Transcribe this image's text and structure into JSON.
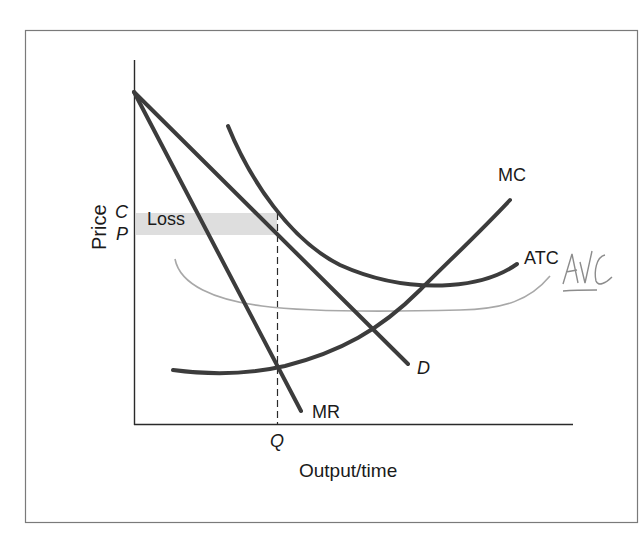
{
  "diagram": {
    "type": "economics-cost-revenue-diagram",
    "frame": {
      "x": 25,
      "y": 30,
      "width": 613,
      "height": 493,
      "stroke": "#777777"
    },
    "axes": {
      "y_label": "Price",
      "x_label": "Output / time",
      "origin": [
        134,
        425
      ],
      "y_top": 60,
      "x_right": 573
    },
    "price_ticks": [
      {
        "label": "C",
        "y": 212
      },
      {
        "label": "P",
        "y": 233
      }
    ],
    "quantity_ticks": [
      {
        "label": "Q",
        "x": 277
      }
    ],
    "loss_region": {
      "label": "Loss",
      "x1": 136,
      "x2": 277,
      "y1": 213,
      "y2": 235,
      "fill": "#dcdcdc"
    },
    "curves": [
      {
        "id": "D",
        "label": "D",
        "italic": true,
        "color": "#3a3a3a"
      },
      {
        "id": "MR",
        "label": "MR",
        "italic": false,
        "color": "#3a3a3a"
      },
      {
        "id": "MC",
        "label": "MC",
        "italic": false,
        "color": "#3a3a3a"
      },
      {
        "id": "ATC",
        "label": "ATC",
        "italic": false,
        "color": "#3a3a3a"
      },
      {
        "id": "AVC",
        "label": "AVC",
        "italic": false,
        "handwritten": true,
        "color": "#9a9a9a"
      }
    ],
    "annotations": {
      "handwritten_label": "AVC",
      "note": "AVC curve and label hand-drawn in pencil"
    }
  },
  "labels": {
    "price": "Price",
    "output": "Output/time",
    "c": "C",
    "p": "P",
    "q": "Q",
    "loss": "Loss",
    "mc": "MC",
    "atc": "ATC",
    "d": "D",
    "mr": "MR",
    "avc": "AVC"
  }
}
